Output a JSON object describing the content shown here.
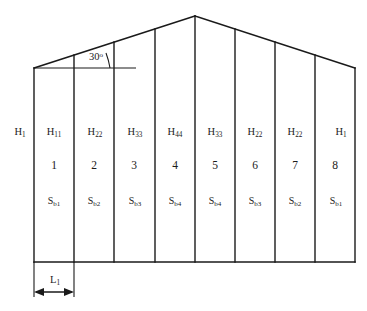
{
  "diagram": {
    "roof_angle_label": "30",
    "roof_angle_unit": "o",
    "width_dimension_label": "L",
    "width_dimension_sub": "1",
    "left_height_label": "H",
    "left_height_sub": "1",
    "stroke_color": "#1a1a1a",
    "background_color": "#ffffff",
    "bays": [
      {
        "number": "1",
        "height_label": "H",
        "height_sub": "11",
        "area_label": "S",
        "area_sub": "b1"
      },
      {
        "number": "2",
        "height_label": "H",
        "height_sub": "22",
        "area_label": "S",
        "area_sub": "b2"
      },
      {
        "number": "3",
        "height_label": "H",
        "height_sub": "33",
        "area_label": "S",
        "area_sub": "b3"
      },
      {
        "number": "4",
        "height_label": "H",
        "height_sub": "44",
        "area_label": "S",
        "area_sub": "b4"
      },
      {
        "number": "5",
        "height_label": "H",
        "height_sub": "33",
        "area_label": "S",
        "area_sub": "b4"
      },
      {
        "number": "6",
        "height_label": "H",
        "height_sub": "22",
        "area_label": "S",
        "area_sub": "b3"
      },
      {
        "number": "7",
        "height_label": "H",
        "height_sub": "22",
        "area_label": "S",
        "area_sub": "b2"
      },
      {
        "number": "8",
        "height_label": "H",
        "height_sub": "1",
        "area_label": "S",
        "area_sub": "b1"
      }
    ]
  }
}
